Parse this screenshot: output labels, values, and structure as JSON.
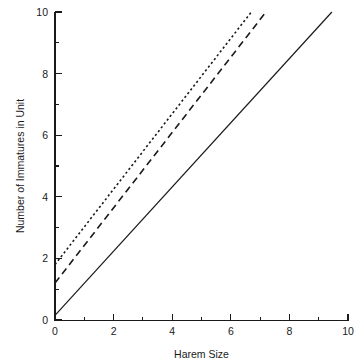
{
  "chart_data": {
    "type": "line",
    "title": "",
    "xlabel": "Harem Size",
    "ylabel": "Number of Immatures in Unit",
    "xlim": [
      0,
      10
    ],
    "ylim": [
      0,
      10
    ],
    "grid": false,
    "legend": "none",
    "x_major_ticks": [
      0,
      2,
      4,
      6,
      8,
      10
    ],
    "x_minor_ticks": [
      1,
      3,
      5,
      7,
      9
    ],
    "y_major_ticks": [
      0,
      2,
      4,
      6,
      8,
      10
    ],
    "y_minor_ticks": [
      1,
      3,
      5,
      7,
      9
    ],
    "x_tick_labels": [
      "0",
      "2",
      "4",
      "6",
      "8",
      "10"
    ],
    "y_tick_labels": [
      "0",
      "2",
      "4",
      "6",
      "8",
      "10"
    ],
    "series": [
      {
        "name": "solid-line",
        "style": "solid",
        "color": "#1a1a1a",
        "intercept": 0.15,
        "slope": 1.04,
        "x": [
          0,
          9.45
        ],
        "values": [
          0.15,
          10
        ]
      },
      {
        "name": "dashed-line",
        "style": "dashed",
        "color": "#1a1a1a",
        "intercept": 1.2,
        "slope": 1.22,
        "x": [
          0,
          7.2
        ],
        "values": [
          1.2,
          10
        ]
      },
      {
        "name": "dotted-line",
        "style": "dotted",
        "color": "#1a1a1a",
        "intercept": 1.8,
        "slope": 1.22,
        "x": [
          0,
          6.7
        ],
        "values": [
          1.8,
          10
        ]
      }
    ]
  },
  "axes": {
    "x_title": "Harem Size",
    "y_title": "Number of Immatures in Unit"
  },
  "caption_fragment": ""
}
